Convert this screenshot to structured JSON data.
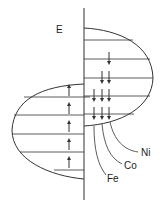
{
  "diagram": {
    "axis_label": "E",
    "labels": [
      {
        "text": "Ni",
        "x": 141,
        "y": 156
      },
      {
        "text": "Co",
        "x": 124,
        "y": 169
      },
      {
        "text": "Fe",
        "x": 107,
        "y": 182
      }
    ],
    "colors": {
      "line": "#333333"
    }
  }
}
